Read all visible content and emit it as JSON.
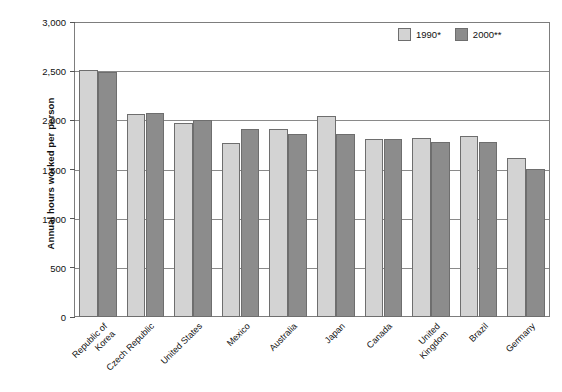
{
  "chart_data": {
    "type": "bar",
    "title": "",
    "subtitle": "",
    "xlabel": "",
    "ylabel": "Annual hours worked per person",
    "ylim": [
      0,
      3000
    ],
    "yticks": [
      "0",
      "500",
      "1,000",
      "1,500",
      "2,000",
      "2,500",
      "3,000"
    ],
    "ytick_values": [
      0,
      500,
      1000,
      1500,
      2000,
      2500,
      3000
    ],
    "grid": true,
    "legend_position": "top-right",
    "categories": [
      "Republic of\nKorea",
      "Czech Republic",
      "United States",
      "Mexico",
      "Australia",
      "Japan",
      "Canada",
      "United\nKingdom",
      "Brazil",
      "Germany"
    ],
    "series": [
      {
        "name": "1990*",
        "color": "#d3d3d3",
        "values": [
          2510,
          2060,
          1970,
          1770,
          1915,
          2040,
          1815,
          1820,
          1840,
          1620
        ]
      },
      {
        "name": "2000**",
        "color": "#8c8c8c",
        "values": [
          2495,
          2075,
          2000,
          1910,
          1860,
          1865,
          1815,
          1780,
          1775,
          1510
        ]
      }
    ]
  },
  "legend": {
    "items": [
      {
        "label": "1990*",
        "series": "1990"
      },
      {
        "label": "2000**",
        "series": "2000"
      }
    ]
  },
  "axis": {
    "y_title": "Annual hours worked per person"
  }
}
